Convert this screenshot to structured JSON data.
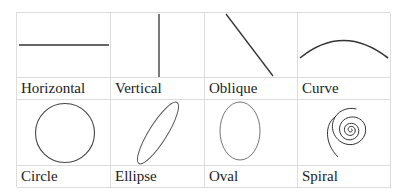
{
  "shapes": [
    {
      "name": "Horizontal",
      "icon": "horizontal-line-icon"
    },
    {
      "name": "Vertical",
      "icon": "vertical-line-icon"
    },
    {
      "name": "Oblique",
      "icon": "oblique-line-icon"
    },
    {
      "name": "Curve",
      "icon": "curve-icon"
    },
    {
      "name": "Circle",
      "icon": "circle-icon"
    },
    {
      "name": "Ellipse",
      "icon": "ellipse-icon"
    },
    {
      "name": "Oval",
      "icon": "oval-icon"
    },
    {
      "name": "Spiral",
      "icon": "spiral-icon"
    }
  ],
  "colors": {
    "stroke": "#333333",
    "grid": "#dcdcdc"
  }
}
